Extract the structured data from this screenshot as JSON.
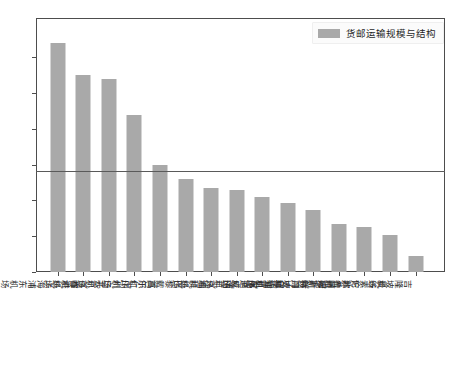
{
  "legend": {
    "label": "货邮运输规模与结构",
    "swatch_color": "#a9a9a9",
    "position": "top-right"
  },
  "axes": {
    "y_ticks": [
      "0.6",
      "0.5",
      "0.4",
      "0.3",
      "0.2",
      "0.1",
      "0.0"
    ],
    "y_label": "",
    "x_label": ""
  },
  "chart_data": {
    "type": "bar",
    "title": "",
    "xlabel": "",
    "ylabel": "",
    "ylim": [
      0.0,
      0.71
    ],
    "ytick_values": [
      0.0,
      0.1,
      0.2,
      0.3,
      0.4,
      0.5,
      0.6
    ],
    "grid": false,
    "legend_position": "top-right",
    "bar_color": "#a9a9a9",
    "reference_line": {
      "value": 0.283,
      "color": "#5a5a5a",
      "orientation": "horizontal",
      "label": ""
    },
    "categories": [
      "上海浦东机场",
      "香港机场",
      "北京首都机场",
      "广州白云机场",
      "首尔仁川机场",
      "巴黎戴高乐机场",
      "迪拜机场",
      "法兰克福机场",
      "东京成田机场",
      "纽约肯尼迪机场",
      "新加坡樟宜机场",
      "阿姆斯特丹史基浦机场",
      "伦敦希思罗机场",
      "曼谷素万那普机场",
      "吉隆坡机场"
    ],
    "series": [
      {
        "name": "货邮运输规模与结构",
        "values": [
          0.64,
          0.55,
          0.54,
          0.44,
          0.3,
          0.26,
          0.235,
          0.23,
          0.21,
          0.193,
          0.172,
          0.134,
          0.127,
          0.104,
          0.046
        ]
      }
    ]
  }
}
